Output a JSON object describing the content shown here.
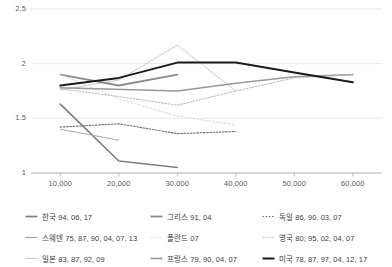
{
  "chart_data": {
    "type": "line",
    "title": "",
    "subtitle": "",
    "xlabel": "",
    "ylabel": "",
    "xlim": [
      5000,
      65000
    ],
    "ylim": [
      1,
      2.5
    ],
    "grid": true,
    "legend_position": "bottom",
    "x_ticks": [
      "10,000",
      "20,000",
      "30,000",
      "40,000",
      "50,000",
      "60,000"
    ],
    "x_tick_values": [
      10000,
      20000,
      30000,
      40000,
      50000,
      60000
    ],
    "y_ticks": [
      "1",
      "1.5",
      "2",
      "2.5"
    ],
    "y_tick_values": [
      1,
      1.5,
      2,
      2.5
    ],
    "series": [
      {
        "name": "한국 94, 06, 17",
        "key": "korea",
        "color": "#7f7f7f",
        "width": 1.7,
        "dash": "none",
        "x": [
          10000,
          20000,
          30000
        ],
        "values": [
          1.63,
          1.11,
          1.05
        ]
      },
      {
        "name": "스웨덴 75, 87, 90, 04, 07, 13",
        "key": "sweden",
        "color": "#a6a6a6",
        "width": 1.0,
        "dash": "none",
        "x": [
          10000,
          20000
        ],
        "values": [
          1.4,
          1.3
        ]
      },
      {
        "name": "일본 83, 87, 92, 09",
        "key": "japan",
        "color": "#cccccc",
        "width": 1.0,
        "dash": "none",
        "x": [
          10000,
          20000,
          30000,
          40000
        ],
        "values": [
          1.76,
          1.85,
          2.17,
          1.75
        ]
      },
      {
        "name": "그리스 91, 04",
        "key": "greece",
        "color": "#8c8c8c",
        "width": 1.8,
        "dash": "none",
        "x": [
          10000,
          20000,
          30000
        ],
        "values": [
          1.9,
          1.8,
          1.9
        ]
      },
      {
        "name": "폴란드 07",
        "key": "poland",
        "color": "#d9d9d9",
        "width": 1.0,
        "dash": "2,2",
        "x": [
          10000,
          20000,
          30000,
          40000
        ],
        "values": [
          1.9,
          1.68,
          1.52,
          1.44
        ]
      },
      {
        "name": "프랑스 79, 90, 04, 07",
        "key": "france",
        "color": "#999999",
        "width": 1.6,
        "dash": "none",
        "x": [
          10000,
          30000,
          40000,
          50000,
          60000
        ],
        "values": [
          1.78,
          1.75,
          1.82,
          1.88,
          1.9
        ]
      },
      {
        "name": "독일 86, 90, 03, 07",
        "key": "germany",
        "color": "#6b6b6b",
        "width": 1.1,
        "dash": "1.6,1.6",
        "x": [
          10000,
          20000,
          30000,
          40000
        ],
        "values": [
          1.42,
          1.45,
          1.36,
          1.38
        ]
      },
      {
        "name": "영국 80, 95, 02, 04, 07",
        "key": "uk",
        "color": "#bdbdbd",
        "width": 1.1,
        "dash": "1.6,1.6",
        "x": [
          10000,
          20000,
          30000,
          40000,
          50000,
          60000
        ],
        "values": [
          1.77,
          1.7,
          1.62,
          1.75,
          1.87,
          1.9
        ]
      },
      {
        "name": "미국 78, 87, 97, 04, 12, 17",
        "key": "usa",
        "color": "#1a1a1a",
        "width": 2.0,
        "dash": "none",
        "x": [
          10000,
          20000,
          30000,
          40000,
          50000,
          60000
        ],
        "values": [
          1.8,
          1.87,
          2.01,
          2.01,
          1.92,
          1.83
        ]
      }
    ]
  },
  "axis": {
    "y_labels": [
      "2.5",
      "2",
      "1.5",
      "1"
    ],
    "x_labels": [
      "10,000",
      "20,000",
      "30,000",
      "40,000",
      "50,000",
      "60,000"
    ]
  },
  "legend": {
    "items": [
      {
        "label": "한국 94, 06, 17",
        "key": "korea"
      },
      {
        "label": "그리스 91, 04",
        "key": "greece"
      },
      {
        "label": "독일 86, 90, 03, 07",
        "key": "germany"
      },
      {
        "label": "스웨덴 75, 87, 90, 04, 07, 13",
        "key": "sweden"
      },
      {
        "label": "폴란드 07",
        "key": "poland"
      },
      {
        "label": "영국 80, 95, 02, 04, 07",
        "key": "uk"
      },
      {
        "label": "일본 83, 87, 92, 09",
        "key": "japan"
      },
      {
        "label": "프랑스 79, 90, 04, 07",
        "key": "france"
      },
      {
        "label": "미국 78, 87, 97, 04, 12, 17",
        "key": "usa"
      }
    ]
  },
  "colors": {
    "gridline": "#e8e8e8",
    "axis": "#b0b0b0",
    "text": "#595959",
    "background": "#ffffff"
  }
}
